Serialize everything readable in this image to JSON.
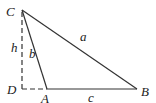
{
  "diagram": {
    "type": "triangle-altitude",
    "vertices": {
      "C": {
        "label": "C",
        "x": 22,
        "y": 10
      },
      "D": {
        "label": "D",
        "x": 22,
        "y": 89
      },
      "A": {
        "label": "A",
        "x": 47,
        "y": 89
      },
      "B": {
        "label": "B",
        "x": 137,
        "y": 89
      }
    },
    "segments": {
      "a": {
        "label": "a",
        "from": "C",
        "to": "B",
        "style": "solid"
      },
      "b": {
        "label": "b",
        "from": "C",
        "to": "A",
        "style": "solid"
      },
      "c": {
        "label": "c",
        "from": "A",
        "to": "B",
        "style": "solid"
      },
      "h": {
        "label": "h",
        "from": "C",
        "to": "D",
        "style": "dashed"
      },
      "DA": {
        "label": "",
        "from": "D",
        "to": "A",
        "style": "dashed"
      }
    },
    "line_color": "#333333"
  }
}
